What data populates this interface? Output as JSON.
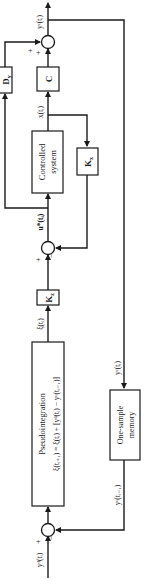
{
  "diagram": {
    "type": "block-diagram",
    "orientation": "rotated-90-ccw",
    "blocks": {
      "dy": {
        "label": "D",
        "sub": "y"
      },
      "c": {
        "label": "C"
      },
      "controlled_system": {
        "line1": "Controlled",
        "line2": "system"
      },
      "kx": {
        "label": "K",
        "sub": "x"
      },
      "kz": {
        "label": "K",
        "sub": "z"
      },
      "pseudointegration": {
        "title": "Pseudointegration",
        "equation": "ξ(tᵢ₊₁) = ξ(tᵢ) + [yᵈ(tᵢ) − yᶜ(tᵢ₋₁)]"
      },
      "memory": {
        "line1": "One-sample",
        "line2": "memory"
      }
    },
    "signals": {
      "yc_out": "yᶜ(tᵢ)",
      "x_state": "x(tᵢ)",
      "u_star": "u*(tᵢ)",
      "xi": "ξ(tᵢ)",
      "yc_mem_in": "yᶜ(tᵢ)",
      "yc_mem_out": "yᶜ(tᵢ₋₁)",
      "yd_in": "yᵈ(tᵢ)"
    },
    "signs": {
      "top_sum": [
        "+",
        "+"
      ],
      "mid_sum": [
        "+",
        "−"
      ],
      "bottom_sum": [
        "+",
        "−"
      ]
    },
    "colors": {
      "line": "#1a1a1a",
      "background": "#ffffff"
    }
  }
}
